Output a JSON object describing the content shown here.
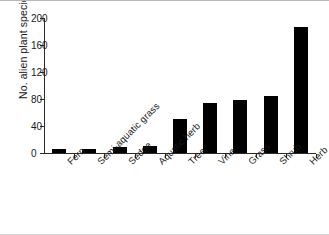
{
  "chart_data": {
    "type": "bar",
    "title": "",
    "xlabel": "",
    "ylabel": "No. alien plant species",
    "categories": [
      "Fern",
      "Semi-aquatic grass",
      "Sedge",
      "Aquatic herb",
      "Tree",
      "Vine",
      "Grass",
      "Shrub",
      "Herb"
    ],
    "values": [
      6,
      6,
      9,
      10,
      50,
      74,
      79,
      85,
      187
    ],
    "ylim": [
      0,
      200
    ],
    "yticks": [
      0,
      40,
      80,
      120,
      160,
      200
    ],
    "ytick_labels": [
      "0",
      "40",
      "80",
      "120",
      "160",
      "200"
    ],
    "grid": false,
    "legend": null,
    "bar_color": "#000000",
    "axis_color": "#2b2b2b",
    "background": "#ffffff"
  }
}
